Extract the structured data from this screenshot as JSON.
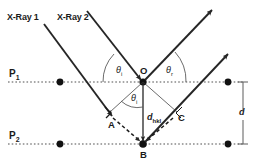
{
  "diagram": {
    "colors": {
      "ink": "#1a1a1a",
      "ray": "#262626",
      "plane": "#7a7a7a",
      "dot": "#111111",
      "background": "#ffffff"
    },
    "labels": {
      "xray1": "X-Ray 1",
      "xray2": "X-Ray 2",
      "plane1": "P",
      "plane1_sub": "1",
      "plane2": "P",
      "plane2_sub": "2",
      "point_o": "O",
      "point_a": "A",
      "point_b": "B",
      "point_c": "C",
      "theta_incident": "θ",
      "theta_incident_sub": "i",
      "theta_reflected": "θ",
      "theta_reflected_sub": "r",
      "theta_bragg": "θ",
      "theta_bragg_sub": "i",
      "d_spacing": "d",
      "d_hkl": "d",
      "d_hkl_sub": "hkl"
    },
    "geometry": {
      "plane1_y": 82,
      "plane2_y": 144,
      "plane_x_start": 8,
      "plane_x_end": 243,
      "point_o": [
        143,
        82
      ],
      "point_b": [
        143,
        144
      ],
      "point_a": [
        110,
        114
      ],
      "point_c": [
        176,
        114
      ],
      "lattice_dots_p1_x": [
        60,
        143,
        228
      ],
      "lattice_dots_p2_x": [
        60,
        143,
        228
      ],
      "dimension_line_x": 243,
      "interplanar_distance_px": 62
    }
  }
}
